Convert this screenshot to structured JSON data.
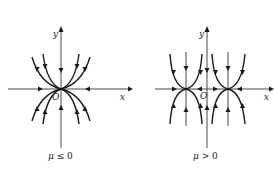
{
  "panels": [
    {
      "id": "left",
      "axis_x_label": "x",
      "axis_y_label": "y",
      "origin_label": "O",
      "caption_var": "μ",
      "caption_rel": " ≤ 0",
      "description": "Single degenerate node at origin; trajectories are parabola-like curves tangent to x-axis converging to O"
    },
    {
      "id": "right",
      "axis_x_label": "x",
      "axis_y_label": "y",
      "origin_label": "O",
      "caption_var": "μ",
      "caption_rel": " > 0",
      "description": "Two equilibrium points on x-axis symmetric about origin; trajectories converge to each"
    }
  ],
  "colors": {
    "stroke": "#1a1a1a",
    "axis": "#333333",
    "background": "#ffffff"
  }
}
